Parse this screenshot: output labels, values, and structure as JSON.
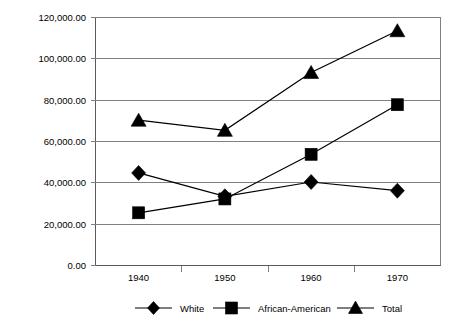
{
  "chart_data": {
    "type": "line",
    "title": "",
    "xlabel": "",
    "ylabel": "",
    "categories": [
      "1940",
      "1950",
      "1960",
      "1970"
    ],
    "ylim": [
      0,
      120000
    ],
    "ytick_values": [
      0,
      20000,
      40000,
      60000,
      80000,
      100000,
      120000
    ],
    "ytick_labels": [
      "0.00",
      "20,000.00",
      "40,000.00",
      "60,000.00",
      "80,000.00",
      "100,000.00",
      "120,000.00"
    ],
    "grid": true,
    "legend_position": "bottom",
    "series": [
      {
        "name": "White",
        "marker": "diamond",
        "color": "#000000",
        "values": [
          44800,
          33500,
          40400,
          36200
        ]
      },
      {
        "name": "African-American",
        "marker": "square",
        "color": "#000000",
        "values": [
          25500,
          32200,
          53800,
          77800
        ]
      },
      {
        "name": "Total",
        "marker": "triangle",
        "color": "#000000",
        "values": [
          70300,
          65400,
          93400,
          113600
        ]
      }
    ]
  },
  "legend": {
    "items": [
      {
        "label": "White",
        "marker": "diamond"
      },
      {
        "label": "African-American",
        "marker": "square"
      },
      {
        "label": "Total",
        "marker": "triangle"
      }
    ]
  },
  "axes": {
    "x_tick_labels": [
      "1940",
      "1950",
      "1960",
      "1970"
    ],
    "y_tick_labels": [
      "120,000.00",
      "100,000.00",
      "80,000.00",
      "60,000.00",
      "40,000.00",
      "20,000.00",
      "0.00"
    ]
  }
}
